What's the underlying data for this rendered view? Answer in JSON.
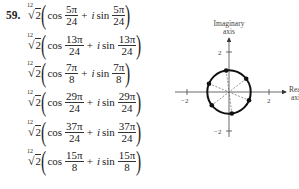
{
  "problem": {
    "number": "59.",
    "root_index": "12",
    "radicand": "2",
    "cos_label": "cos",
    "sin_label": "sin",
    "plus": "+",
    "imag_unit": "i",
    "terms": [
      {
        "num": "5π",
        "den": "24"
      },
      {
        "num": "13π",
        "den": "24"
      },
      {
        "num": "7π",
        "den": "8"
      },
      {
        "num": "29π",
        "den": "24"
      },
      {
        "num": "37π",
        "den": "24"
      },
      {
        "num": "15π",
        "den": "8"
      }
    ]
  },
  "chart_data": {
    "type": "scatter",
    "title": "",
    "xlabel": "Real axis",
    "ylabel": "Imaginary axis",
    "xlim": [
      -2.5,
      2.5
    ],
    "ylim": [
      -2.5,
      2.5
    ],
    "x_ticks": [
      "-2",
      "2"
    ],
    "y_ticks": [
      "2",
      "-2"
    ],
    "circle_radius": 1.059,
    "points_angles_deg": [
      37.5,
      97.5,
      157.5,
      217.5,
      277.5,
      337.5
    ],
    "points": [
      {
        "x": 0.84,
        "y": 0.64
      },
      {
        "x": -0.14,
        "y": 1.05
      },
      {
        "x": -0.98,
        "y": 0.41
      },
      {
        "x": -0.84,
        "y": -0.64
      },
      {
        "x": 0.14,
        "y": -1.05
      },
      {
        "x": 0.98,
        "y": -0.41
      }
    ],
    "dashed_lines": "diameters through opposite roots",
    "grid": false
  },
  "graph": {
    "y_axis_label_1": "Imaginary",
    "y_axis_label_2": "axis",
    "x_axis_label_1": "Real",
    "x_axis_label_2": "axis",
    "tick_pos": "2",
    "tick_neg": "−2"
  }
}
